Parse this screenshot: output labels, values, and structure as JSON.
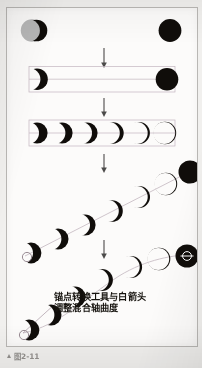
{
  "page": {
    "background_color": "#f1f0ee",
    "plate_background_color": "#fcfbfa",
    "plate_border_color": "#b9b7b4"
  },
  "figure": {
    "caption_marker": "▲",
    "caption_text": "图2-11"
  },
  "plate_caption": {
    "line1": "锚点转换工具与白箭头",
    "line2": "调整混合轴曲度"
  },
  "colors": {
    "ink": "#100d0a",
    "gray_moon": "#b7b7b7",
    "guide": "#b9a9b4",
    "arrow": "#4b4a49",
    "anchor_stroke": "#8d7f88"
  },
  "steps": [
    {
      "id": "step-1",
      "name": "two-source-objects",
      "description": "Gray disc overlapped by black crescent on the left, solid black disc on the right",
      "left_shape": "gray-disc-with-black-crescent",
      "right_shape": "solid-black-disc"
    },
    {
      "id": "step-2",
      "name": "selected-crescent-and-disc",
      "description": "Black crescent and solid black disc selected inside a bounding box with guide lines",
      "left_shape": "black-crescent",
      "right_shape": "solid-black-disc",
      "bounding_box": true
    },
    {
      "id": "step-3",
      "name": "straight-blend",
      "description": "Horizontal blend of six steps from crescent to full disc along a straight spine",
      "step_count": 6,
      "spine": "straight-horizontal"
    },
    {
      "id": "step-4",
      "name": "diagonal-blend",
      "description": "Blend spine rotated to a rising diagonal, seven steps from crescent to full disc",
      "step_count": 7,
      "spine": "straight-diagonal"
    },
    {
      "id": "step-5",
      "name": "curved-blend",
      "description": "Blend spine converted to a curve with the anchor point tool, seven steps",
      "step_count": 7,
      "spine": "curved",
      "anchor_point_visible": true,
      "direction_handle_visible": true
    }
  ],
  "arrows": [
    {
      "name": "arrow-step1-to-step2",
      "direction": "down"
    },
    {
      "name": "arrow-step2-to-step3",
      "direction": "down"
    },
    {
      "name": "arrow-step3-to-step4",
      "direction": "down"
    },
    {
      "name": "arrow-step4-to-step5",
      "direction": "down"
    }
  ]
}
